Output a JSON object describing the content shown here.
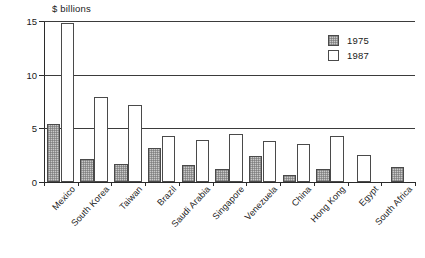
{
  "chart_data": {
    "type": "bar",
    "title": "",
    "xlabel": "",
    "ylabel": "$ billions",
    "ylim": [
      0,
      15
    ],
    "yticks": [
      0,
      5,
      10,
      15
    ],
    "ytick_labels": [
      "0",
      "5",
      "10",
      "15"
    ],
    "grid": true,
    "legend_position": "top-right",
    "categories": [
      "Mexico",
      "South Korea",
      "Taiwan",
      "Brazil",
      "Saudi Arabia",
      "Singapore",
      "Venezuela",
      "China",
      "Hong Kong",
      "Egypt",
      "South Africa"
    ],
    "series": [
      {
        "name": "1975",
        "values": [
          5.4,
          2.1,
          1.7,
          3.2,
          1.6,
          1.2,
          2.4,
          0.7,
          1.2,
          null,
          1.4
        ]
      },
      {
        "name": "1987",
        "values": [
          14.8,
          7.9,
          7.2,
          4.3,
          3.9,
          4.5,
          3.8,
          3.5,
          4.3,
          2.5,
          null
        ]
      }
    ]
  },
  "legend": {
    "entries": [
      {
        "label": "1975",
        "style": "hatched-gray"
      },
      {
        "label": "1987",
        "style": "white-outline"
      }
    ]
  }
}
